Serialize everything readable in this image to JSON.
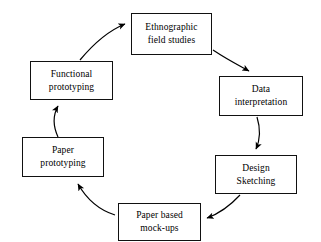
{
  "diagram": {
    "type": "cycle-flow-diagram",
    "direction": "clockwise",
    "colors": {
      "background": "#ffffff",
      "box_border": "#111111",
      "box_fill": "#ffffff",
      "arrow": "#000000",
      "text": "#000000"
    },
    "nodes": [
      {
        "id": "ethnographic",
        "label": "Ethnographic field studies",
        "line1": "Ethnographic",
        "line2": "field studies"
      },
      {
        "id": "data-interpretation",
        "label": "Data interpretation",
        "line1": "Data",
        "line2": "interpretation"
      },
      {
        "id": "design-sketching",
        "label": "Design Sketching",
        "line1": "Design",
        "line2": "Sketching"
      },
      {
        "id": "paper-based-mock-ups",
        "label": "Paper based mock-ups",
        "line1": "Paper based",
        "line2": "mock-ups"
      },
      {
        "id": "paper-prototyping",
        "label": "Paper prototyping",
        "line1": "Paper",
        "line2": "prototyping"
      },
      {
        "id": "functional-prototyping",
        "label": "Functional prototyping",
        "line1": "Functional",
        "line2": "prototyping"
      }
    ],
    "edges": [
      {
        "id": "edge-1",
        "from": "ethnographic",
        "to": "data-interpretation",
        "style": "curved-arrow"
      },
      {
        "id": "edge-2",
        "from": "data-interpretation",
        "to": "design-sketching",
        "style": "curved-arrow"
      },
      {
        "id": "edge-3",
        "from": "design-sketching",
        "to": "paper-based-mock-ups",
        "style": "curved-arrow"
      },
      {
        "id": "edge-4",
        "from": "paper-based-mock-ups",
        "to": "paper-prototyping",
        "style": "curved-arrow"
      },
      {
        "id": "edge-5",
        "from": "paper-prototyping",
        "to": "functional-prototyping",
        "style": "curved-arrow"
      },
      {
        "id": "edge-6",
        "from": "functional-prototyping",
        "to": "ethnographic",
        "style": "curved-arrow"
      }
    ]
  }
}
